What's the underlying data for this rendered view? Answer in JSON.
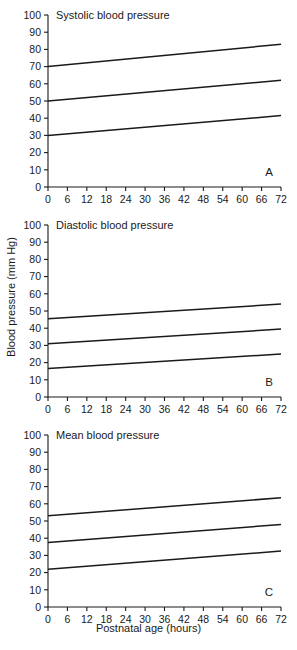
{
  "figure": {
    "x_axis_title": "Postnatal age (hours)",
    "y_axis_title": "Blood pressure (mm Hg)"
  },
  "chart_data": [
    {
      "type": "line",
      "panel_letter": "A",
      "title": "Systolic blood pressure",
      "xlabel": "Postnatal age (hours)",
      "ylabel": "Blood pressure (mm Hg)",
      "xlim": [
        0,
        72
      ],
      "ylim": [
        0,
        100
      ],
      "xticks": [
        0,
        6,
        12,
        18,
        24,
        30,
        36,
        42,
        48,
        54,
        60,
        66,
        72
      ],
      "yticks": [
        0,
        10,
        20,
        30,
        40,
        50,
        60,
        70,
        80,
        90,
        100
      ],
      "grid": false,
      "legend": "none",
      "x": [
        0,
        72
      ],
      "series": [
        {
          "name": "upper",
          "values": [
            70,
            83
          ]
        },
        {
          "name": "middle",
          "values": [
            50,
            62
          ]
        },
        {
          "name": "lower",
          "values": [
            30,
            41.5
          ]
        }
      ]
    },
    {
      "type": "line",
      "panel_letter": "B",
      "title": "Diastolic blood pressure",
      "xlabel": "Postnatal age (hours)",
      "ylabel": "Blood pressure (mm Hg)",
      "xlim": [
        0,
        72
      ],
      "ylim": [
        0,
        100
      ],
      "xticks": [
        0,
        6,
        12,
        18,
        24,
        30,
        36,
        42,
        48,
        54,
        60,
        66,
        72
      ],
      "yticks": [
        0,
        10,
        20,
        30,
        40,
        50,
        60,
        70,
        80,
        90,
        100
      ],
      "grid": false,
      "legend": "none",
      "x": [
        0,
        72
      ],
      "series": [
        {
          "name": "upper",
          "values": [
            45.5,
            54
          ]
        },
        {
          "name": "middle",
          "values": [
            31,
            39.5
          ]
        },
        {
          "name": "lower",
          "values": [
            16.5,
            25
          ]
        }
      ]
    },
    {
      "type": "line",
      "panel_letter": "C",
      "title": "Mean blood pressure",
      "xlabel": "Postnatal age (hours)",
      "ylabel": "Blood pressure (mm Hg)",
      "xlim": [
        0,
        72
      ],
      "ylim": [
        0,
        100
      ],
      "xticks": [
        0,
        6,
        12,
        18,
        24,
        30,
        36,
        42,
        48,
        54,
        60,
        66,
        72
      ],
      "yticks": [
        0,
        10,
        20,
        30,
        40,
        50,
        60,
        70,
        80,
        90,
        100
      ],
      "grid": false,
      "legend": "none",
      "x": [
        0,
        72
      ],
      "series": [
        {
          "name": "upper",
          "values": [
            53,
            63.5
          ]
        },
        {
          "name": "middle",
          "values": [
            37.5,
            48
          ]
        },
        {
          "name": "lower",
          "values": [
            22,
            32.5
          ]
        }
      ]
    }
  ]
}
